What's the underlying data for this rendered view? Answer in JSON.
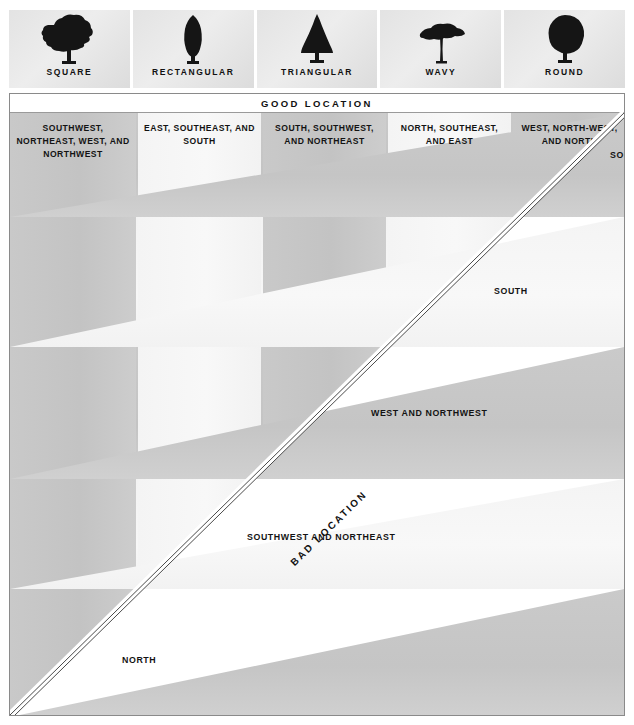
{
  "figure": {
    "type": "matrix",
    "good_location_header": "GOOD LOCATION",
    "bad_location_label": "BAD LOCATION"
  },
  "tree_shapes": [
    {
      "name": "SQUARE",
      "icon": "square-tree-icon"
    },
    {
      "name": "RECTANGULAR",
      "icon": "rectangular-tree-icon"
    },
    {
      "name": "TRIANGULAR",
      "icon": "triangular-tree-icon"
    },
    {
      "name": "WAVY",
      "icon": "wavy-tree-icon"
    },
    {
      "name": "ROUND",
      "icon": "round-tree-icon"
    }
  ],
  "good_columns": [
    {
      "shape": "SQUARE",
      "directions": "SOUTHWEST, NORTHEAST, WEST, AND NORTHWEST"
    },
    {
      "shape": "RECTANGULAR",
      "directions": "EAST, SOUTHEAST, AND SOUTH"
    },
    {
      "shape": "TRIANGULAR",
      "directions": "SOUTH, SOUTHWEST, AND NORTHEAST"
    },
    {
      "shape": "WAVY",
      "directions": "NORTH, SOUTHEAST, AND EAST"
    },
    {
      "shape": "ROUND",
      "directions": "WEST, NORTH-WEST, AND NORTH"
    }
  ],
  "bad_rows": [
    {
      "shape": "ROUND",
      "directions": "SOU… AND…",
      "clipped": true
    },
    {
      "shape": "WAVY",
      "directions": "SOUTH"
    },
    {
      "shape": "TRIANGULAR",
      "directions": "WEST AND NORTHWEST"
    },
    {
      "shape": "RECTANGULAR",
      "directions": "SOUTHWEST AND NORTHEAST"
    },
    {
      "shape": "SQUARE",
      "directions": "NORTH"
    }
  ],
  "colors": {
    "band_dark": "#c6c6c6",
    "band_light": "#f4f4f4",
    "background": "#ffffff",
    "frame_border": "#8a8a8a",
    "text": "#111111"
  }
}
